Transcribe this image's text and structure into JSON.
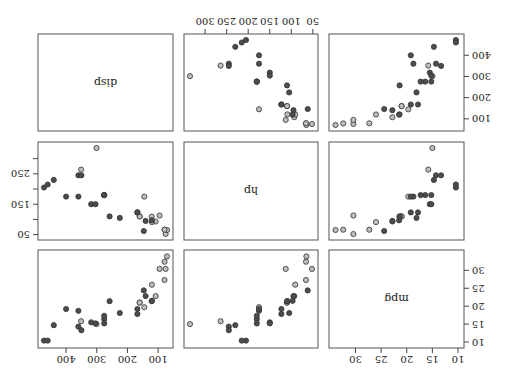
{
  "figure": {
    "orientation_degrees": 180,
    "title": "",
    "point_colors": {
      "group_a_fill": "#bdbdbd",
      "group_b_fill": "#4d4d4d",
      "stroke": "#333333"
    },
    "groups": [
      "am = 1 (light)",
      "am = 0 (dark)"
    ]
  },
  "chart_data": {
    "type": "scatter",
    "subtype": "pairs_matrix",
    "variables": [
      "mpg",
      "hp",
      "disp"
    ],
    "diagonal_labels": [
      "mpg",
      "hp",
      "disp"
    ],
    "axes": {
      "mpg": {
        "ticks": [
          10,
          15,
          20,
          25,
          30
        ],
        "range": [
          10,
          34
        ]
      },
      "hp": {
        "ticks": [
          50,
          100,
          150,
          200,
          250,
          300
        ],
        "tick_labels_shown": [
          50,
          100,
          150,
          200,
          250,
          300
        ],
        "range": [
          52,
          335
        ]
      },
      "disp": {
        "ticks": [
          100,
          200,
          300,
          400
        ],
        "range": [
          71,
          472
        ]
      }
    },
    "grid": false,
    "legend": null,
    "series": [
      {
        "name": "light",
        "points": [
          {
            "mpg": 21.0,
            "hp": 110,
            "disp": 160.0
          },
          {
            "mpg": 21.0,
            "hp": 110,
            "disp": 160.0
          },
          {
            "mpg": 22.8,
            "hp": 93,
            "disp": 108.0
          },
          {
            "mpg": 32.4,
            "hp": 66,
            "disp": 78.7
          },
          {
            "mpg": 30.4,
            "hp": 52,
            "disp": 75.7
          },
          {
            "mpg": 33.9,
            "hp": 65,
            "disp": 71.1
          },
          {
            "mpg": 27.3,
            "hp": 66,
            "disp": 79.0
          },
          {
            "mpg": 26.0,
            "hp": 91,
            "disp": 120.3
          },
          {
            "mpg": 30.4,
            "hp": 113,
            "disp": 95.1
          },
          {
            "mpg": 15.8,
            "hp": 264,
            "disp": 351.0
          },
          {
            "mpg": 19.7,
            "hp": 175,
            "disp": 145.0
          },
          {
            "mpg": 15.0,
            "hp": 335,
            "disp": 301.0
          },
          {
            "mpg": 21.4,
            "hp": 109,
            "disp": 121.0
          }
        ]
      },
      {
        "name": "dark",
        "points": [
          {
            "mpg": 21.4,
            "hp": 110,
            "disp": 258.0
          },
          {
            "mpg": 18.7,
            "hp": 175,
            "disp": 360.0
          },
          {
            "mpg": 18.1,
            "hp": 105,
            "disp": 225.0
          },
          {
            "mpg": 14.3,
            "hp": 245,
            "disp": 360.0
          },
          {
            "mpg": 24.4,
            "hp": 62,
            "disp": 146.7
          },
          {
            "mpg": 22.8,
            "hp": 95,
            "disp": 140.8
          },
          {
            "mpg": 19.2,
            "hp": 123,
            "disp": 167.6
          },
          {
            "mpg": 17.8,
            "hp": 123,
            "disp": 167.6
          },
          {
            "mpg": 16.4,
            "hp": 180,
            "disp": 275.8
          },
          {
            "mpg": 17.3,
            "hp": 180,
            "disp": 275.8
          },
          {
            "mpg": 15.2,
            "hp": 180,
            "disp": 275.8
          },
          {
            "mpg": 10.4,
            "hp": 205,
            "disp": 472.0
          },
          {
            "mpg": 10.4,
            "hp": 215,
            "disp": 460.0
          },
          {
            "mpg": 14.7,
            "hp": 230,
            "disp": 440.0
          },
          {
            "mpg": 21.5,
            "hp": 97,
            "disp": 120.1
          },
          {
            "mpg": 15.5,
            "hp": 150,
            "disp": 318.0
          },
          {
            "mpg": 15.2,
            "hp": 150,
            "disp": 304.0
          },
          {
            "mpg": 13.3,
            "hp": 245,
            "disp": 350.0
          },
          {
            "mpg": 19.2,
            "hp": 175,
            "disp": 400.0
          }
        ]
      }
    ]
  }
}
